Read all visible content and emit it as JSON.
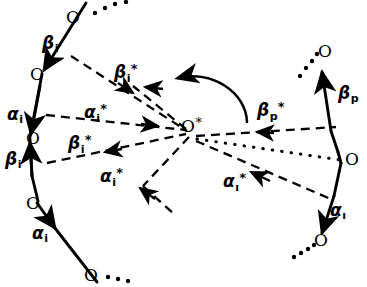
{
  "figure": {
    "background_color": "#ffffff",
    "ink_color": "#000000",
    "width": 367,
    "height": 287
  },
  "center": {
    "label_base": "O",
    "label_star": "*",
    "x": 191,
    "y": 133
  },
  "left_chain": {
    "nodes": [
      {
        "label": "O",
        "x": 68,
        "y": 18,
        "lx": 66,
        "ly": 10
      },
      {
        "label": "O",
        "x": 42,
        "y": 74,
        "lx": 30,
        "ly": 67
      },
      {
        "label": "O",
        "x": 30,
        "y": 139,
        "lx": 26,
        "ly": 131
      },
      {
        "label": "O",
        "x": 37,
        "y": 203,
        "lx": 27,
        "ly": 196
      },
      {
        "label": "O",
        "x": 91,
        "y": 275,
        "lx": 84,
        "ly": 268
      }
    ],
    "vectors": [
      {
        "label_base": "β",
        "sub": "i",
        "star": "",
        "lx": 43,
        "ly": 36
      },
      {
        "label_base": "α",
        "sub": "i",
        "star": "",
        "lx": 8,
        "ly": 107
      },
      {
        "label_base": "β",
        "sub": "i",
        "star": "",
        "lx": 6,
        "ly": 152
      },
      {
        "label_base": "α",
        "sub": "i",
        "star": "",
        "lx": 32,
        "ly": 226
      }
    ]
  },
  "right_chain": {
    "nodes": [
      {
        "label": "O",
        "x": 327,
        "y": 52,
        "lx": 318,
        "ly": 44
      },
      {
        "label": "O",
        "x": 344,
        "y": 160,
        "lx": 345,
        "ly": 152
      },
      {
        "label": "O",
        "x": 321,
        "y": 240,
        "lx": 314,
        "ly": 233
      }
    ],
    "vectors": [
      {
        "label_base": "β",
        "sub": "p",
        "star": "",
        "lx": 338,
        "ly": 86
      },
      {
        "label_base": "α",
        "sub": "ı",
        "star": "",
        "lx": 330,
        "ly": 203
      }
    ]
  },
  "star_vectors": [
    {
      "label_base": "β",
      "sub": "i",
      "star": "*",
      "lx": 115,
      "ly": 63,
      "name": "beta-i-star-upper"
    },
    {
      "label_base": "α",
      "sub": "i",
      "star": "*",
      "lx": 85,
      "ly": 103,
      "name": "alpha-i-star-upper"
    },
    {
      "label_base": "β",
      "sub": "i",
      "star": "*",
      "lx": 69,
      "ly": 134,
      "name": "beta-i-star-lower"
    },
    {
      "label_base": "α",
      "sub": "i",
      "star": "*",
      "lx": 101,
      "ly": 167,
      "name": "alpha-i-star-lower"
    },
    {
      "label_base": "α",
      "sub": "ı",
      "star": "*",
      "lx": 224,
      "ly": 172,
      "name": "alpha-iota-star-right"
    },
    {
      "label_base": "β",
      "sub": "p",
      "star": "*",
      "lx": 258,
      "ly": 101,
      "name": "beta-p-star-right"
    }
  ],
  "ellipses": [
    {
      "name": "ellipsis-top-left",
      "points": [
        [
          93,
          13
        ],
        [
          102,
          8
        ],
        [
          111,
          4
        ],
        [
          120,
          1
        ]
      ]
    },
    {
      "name": "ellipsis-bottom-left",
      "points": [
        [
          105,
          277
        ],
        [
          114,
          279
        ],
        [
          123,
          281
        ]
      ]
    },
    {
      "name": "ellipsis-top-right",
      "points": [
        [
          300,
          74
        ],
        [
          306,
          67
        ],
        [
          311,
          60
        ],
        [
          315,
          53
        ]
      ]
    },
    {
      "name": "ellipsis-bottom-right",
      "points": [
        [
          296,
          253
        ],
        [
          303,
          249
        ],
        [
          310,
          245
        ],
        [
          316,
          242
        ]
      ]
    }
  ],
  "curved_arrow": {
    "name": "rotation-arrow",
    "path": "M 246 120 C 243 88, 210 72, 178 80",
    "tip": [
      154,
      90
    ]
  },
  "dotted_axis": {
    "name": "dotted-axis-to-right-chain",
    "from": [
      196,
      139
    ],
    "to": [
      341,
      160
    ]
  }
}
